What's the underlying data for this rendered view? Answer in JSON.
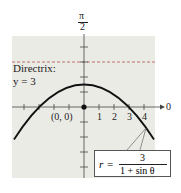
{
  "figure": {
    "type": "polar_conic_graph",
    "axis_labels": {
      "top_numerator": "π",
      "top_denominator": "2",
      "polar_axis": "0"
    },
    "directrix_label": {
      "line1": "Directrix:",
      "line2": "y = 3"
    },
    "origin_label": "(0, 0)",
    "tick_labels": [
      "1",
      "2",
      "3",
      "4"
    ],
    "equation": {
      "lhs": "r",
      "equals": "=",
      "numerator": "3",
      "denominator": "1 + sin θ"
    },
    "colors": {
      "plot_background": "#ebebe6",
      "curve": "#111111",
      "directrix": "#b05050",
      "axis": "#333333"
    },
    "curve": {
      "kind": "parabola",
      "eccentricity": 1,
      "vertex": [
        0,
        1.5
      ],
      "x_intercepts": [
        -3,
        3
      ],
      "directrix_y": 3
    }
  }
}
